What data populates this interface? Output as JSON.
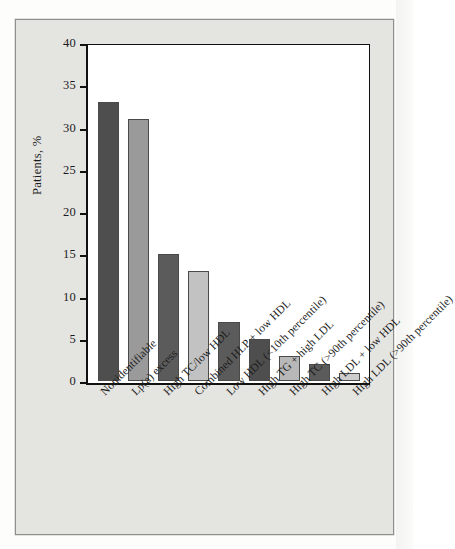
{
  "figure": {
    "background_color": "#e4e4e1",
    "plot_background_color": "#ffffff",
    "axis_color": "#111111"
  },
  "chart_data": {
    "type": "bar",
    "title": "",
    "xlabel": "",
    "ylabel": "Patients, %",
    "ylim": [
      0,
      40
    ],
    "yticks": [
      "0",
      "5",
      "10",
      "15",
      "20",
      "25",
      "30",
      "35",
      "40"
    ],
    "ytick_values": [
      0,
      5,
      10,
      15,
      20,
      25,
      30,
      35,
      40
    ],
    "grid": false,
    "legend": null,
    "categories": [
      "Nonidentifiable",
      "Lp(a) excess",
      "High TC/low HDL",
      "Combined HLP + low HDL",
      "Low HDL (<10th percentile)",
      "High TG + high LDL",
      "High TC (>90th percentile)",
      "High LDL + low HDL",
      "High LDL (>90th percentile)"
    ],
    "values": [
      33,
      31,
      15,
      13,
      7,
      5,
      3,
      2,
      1
    ],
    "bar_colors": [
      "#4e4e4e",
      "#9a9a9a",
      "#5b5b5b",
      "#c2c2c2",
      "#5b5b5b",
      "#4e4e4e",
      "#b8b8b8",
      "#5b5b5b",
      "#cdcdcd"
    ]
  }
}
